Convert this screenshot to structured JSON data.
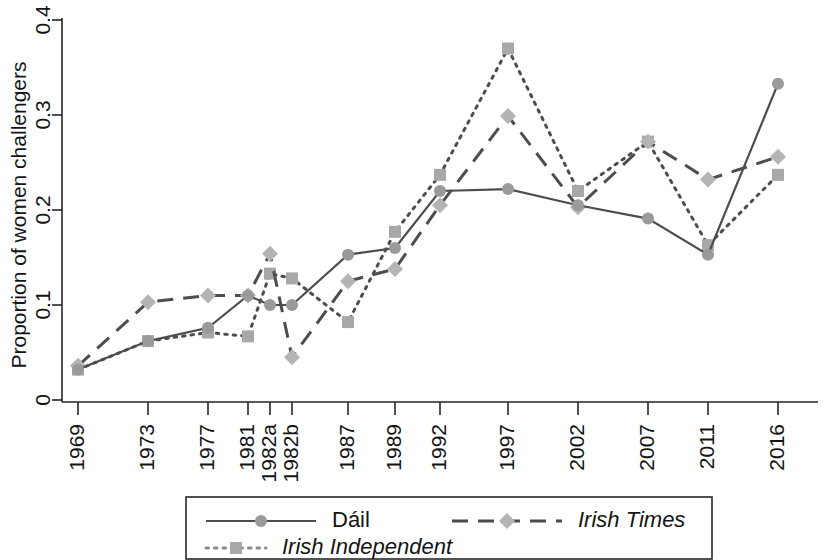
{
  "chart_data": {
    "type": "line",
    "title": "",
    "xlabel": "",
    "ylabel": "Proportion of women challengers",
    "ylim": [
      0,
      0.4
    ],
    "yticks": [
      0,
      0.1,
      0.2,
      0.3,
      0.4
    ],
    "ytick_labels": [
      "0",
      "0.1",
      "0.2",
      "0.3",
      "0.4"
    ],
    "grid": false,
    "legend_position": "bottom",
    "categories": [
      "1969",
      "1973",
      "1977",
      "1981",
      "1982a",
      "1982b",
      "1987",
      "1989",
      "1992",
      "1997",
      "2002",
      "2007",
      "2011",
      "2016"
    ],
    "series": [
      {
        "name": "Dáil",
        "style": "solid",
        "marker": "circle",
        "color": "#9a9a9a",
        "line_color": "#4d4d4d",
        "italic": false,
        "values": [
          0.032,
          0.062,
          0.076,
          0.11,
          0.1,
          0.1,
          0.153,
          0.16,
          0.22,
          0.222,
          0.205,
          0.191,
          0.153,
          0.333
        ]
      },
      {
        "name": "Irish Independent",
        "style": "dotted",
        "marker": "square",
        "color": "#a8a8a8",
        "line_color": "#8a8a8a",
        "italic": true,
        "values": [
          0.032,
          0.062,
          0.071,
          0.067,
          0.133,
          0.128,
          0.082,
          0.177,
          0.237,
          0.37,
          0.22,
          0.272,
          0.163,
          0.237
        ]
      },
      {
        "name": "Irish Times",
        "style": "dashed",
        "marker": "diamond",
        "color": "#b4b4b4",
        "line_color": "#4d4d4d",
        "italic": true,
        "values": [
          0.036,
          0.103,
          0.11,
          0.11,
          0.154,
          0.045,
          0.125,
          0.138,
          0.205,
          0.299,
          0.203,
          0.272,
          0.232,
          0.256
        ]
      }
    ]
  },
  "axis": {
    "y_title": "Proportion of women challengers",
    "y_tick_0": "0",
    "y_tick_1": "0.1",
    "y_tick_2": "0.2",
    "y_tick_3": "0.3",
    "y_tick_4": "0.4",
    "x_tick_0": "1969",
    "x_tick_1": "1973",
    "x_tick_2": "1977",
    "x_tick_3": "1981",
    "x_tick_4": "1982a",
    "x_tick_5": "1982b",
    "x_tick_6": "1987",
    "x_tick_7": "1989",
    "x_tick_8": "1992",
    "x_tick_9": "1997",
    "x_tick_10": "2002",
    "x_tick_11": "2007",
    "x_tick_12": "2011",
    "x_tick_13": "2016"
  },
  "legend": {
    "item_dail": "Dáil",
    "item_irish_independent": "Irish Independent",
    "item_irish_times": "Irish Times"
  }
}
